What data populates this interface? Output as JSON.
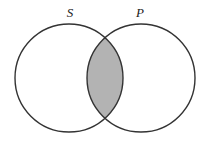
{
  "diagram": {
    "type": "venn-two-set",
    "title": "",
    "background_color": "#ffffff",
    "stroke_color": "#333333",
    "stroke_width": 1.4,
    "shaded_region": "intersection",
    "shade_color": "#b3b3b3",
    "sets": [
      {
        "id": "S",
        "label": "S",
        "position": "left",
        "circle": {
          "cx": 69,
          "cy": 78,
          "r": 54
        },
        "label_pos": {
          "x": 70,
          "y": 17
        },
        "fill": "#ffffff"
      },
      {
        "id": "P",
        "label": "P",
        "position": "right",
        "circle": {
          "cx": 141,
          "cy": 78,
          "r": 54
        },
        "label_pos": {
          "x": 140,
          "y": 17
        },
        "fill": "#ffffff"
      }
    ],
    "intersection": {
      "shaded": true,
      "top_point": {
        "x": 105,
        "y": 32
      },
      "bottom_point": {
        "x": 105,
        "y": 124
      },
      "fill": "#b3b3b3"
    }
  }
}
